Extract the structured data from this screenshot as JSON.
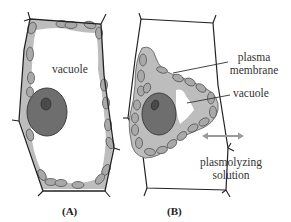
{
  "diagram": {
    "panels": [
      {
        "id": "A",
        "label": "(A)"
      },
      {
        "id": "B",
        "label": "(B)"
      }
    ],
    "labels": {
      "vacuole_a": "vacuole",
      "plasma_membrane_line1": "plasma",
      "plasma_membrane_line2": "membrane",
      "vacuole_b": "vacuole",
      "plasmolyzing_line1": "plasmolyzing",
      "plasmolyzing_line2": "solution"
    },
    "colors": {
      "cell_wall": "#222222",
      "cytoplasm": "#b8b8b8",
      "chloroplast_fill": "#a9a9a9",
      "chloroplast_stroke": "#555555",
      "nucleus": "#6e6e6e",
      "nucleolus": "#4a4a4a",
      "arrow": "#9a9a9a"
    }
  }
}
